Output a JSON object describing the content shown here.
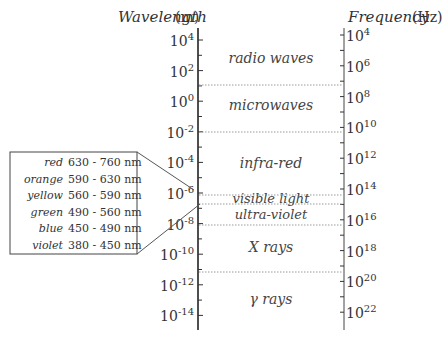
{
  "axes": {
    "wavelength": {
      "title": "Wavelength",
      "unit": "(m)",
      "ticks": [
        {
          "base": "10",
          "exp": "4"
        },
        {
          "base": "10",
          "exp": "2"
        },
        {
          "base": "10",
          "exp": "0"
        },
        {
          "base": "10",
          "exp": "-2"
        },
        {
          "base": "10",
          "exp": "-4"
        },
        {
          "base": "10",
          "exp": "-6"
        },
        {
          "base": "10",
          "exp": "-8"
        },
        {
          "base": "10",
          "exp": "-10"
        },
        {
          "base": "10",
          "exp": "-12"
        },
        {
          "base": "10",
          "exp": "-14"
        }
      ]
    },
    "frequency": {
      "title": "Frequency",
      "unit": "(Hz)",
      "ticks": [
        {
          "base": "10",
          "exp": "4"
        },
        {
          "base": "10",
          "exp": "6"
        },
        {
          "base": "10",
          "exp": "8"
        },
        {
          "base": "10",
          "exp": "10"
        },
        {
          "base": "10",
          "exp": "12"
        },
        {
          "base": "10",
          "exp": "14"
        },
        {
          "base": "10",
          "exp": "16"
        },
        {
          "base": "10",
          "exp": "18"
        },
        {
          "base": "10",
          "exp": "20"
        },
        {
          "base": "10",
          "exp": "22"
        }
      ]
    }
  },
  "bands": [
    {
      "label": "radio waves"
    },
    {
      "label": "microwaves"
    },
    {
      "label": "infra-red"
    },
    {
      "label": "visible light"
    },
    {
      "label": "ultra-violet"
    },
    {
      "label": "X rays"
    },
    {
      "label": "γ rays"
    }
  ],
  "visible_spectrum": [
    {
      "color": "red",
      "range": "630 - 760 nm"
    },
    {
      "color": "orange",
      "range": "590 - 630 nm"
    },
    {
      "color": "yellow",
      "range": "560 - 590 nm"
    },
    {
      "color": "green",
      "range": "490 - 560 nm"
    },
    {
      "color": "blue",
      "range": "450 - 490 nm"
    },
    {
      "color": "violet",
      "range": "380 - 450 nm"
    }
  ],
  "colors": {
    "ink": "#333333",
    "dotted": "#9a9a9a"
  }
}
